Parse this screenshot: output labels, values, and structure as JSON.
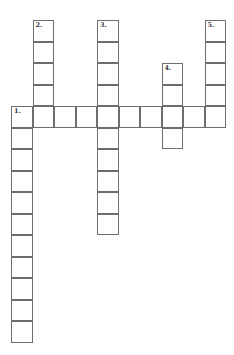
{
  "puzzle": {
    "type": "crossword",
    "cell_size": 21.5,
    "origin": {
      "x": 11,
      "y": 20
    },
    "border_color": "#6e6e6e",
    "words": [
      {
        "number": "1.",
        "direction": "across",
        "row": 4,
        "col": 0,
        "length": 10
      },
      {
        "number": "1.",
        "direction": "down",
        "row": 4,
        "col": 0,
        "length": 11
      },
      {
        "number": "2.",
        "direction": "down",
        "row": 0,
        "col": 1,
        "length": 5
      },
      {
        "number": "3.",
        "direction": "down",
        "row": 0,
        "col": 4,
        "length": 10
      },
      {
        "number": "4.",
        "direction": "down",
        "row": 2,
        "col": 7,
        "length": 4
      },
      {
        "number": "5.",
        "direction": "down",
        "row": 0,
        "col": 9,
        "length": 5
      }
    ],
    "labels": [
      {
        "number": "1.",
        "row": 4,
        "col": 0
      },
      {
        "number": "2.",
        "row": 0,
        "col": 1
      },
      {
        "number": "3.",
        "row": 0,
        "col": 4
      },
      {
        "number": "4.",
        "row": 2,
        "col": 7
      },
      {
        "number": "5.",
        "row": 0,
        "col": 9
      }
    ]
  }
}
